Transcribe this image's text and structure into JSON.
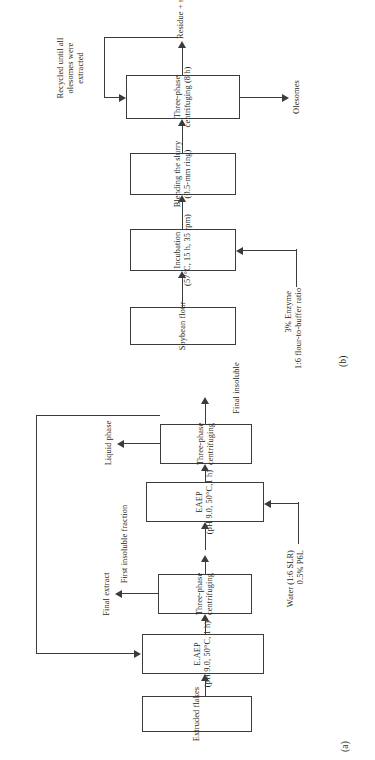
{
  "figure": {
    "type": "process-flow-diagram",
    "orientation": "rotated-90-ccw",
    "panels": [
      "a",
      "b"
    ]
  },
  "panel_b": {
    "tag": "(b)",
    "nodes": [
      {
        "id": "soybean-flour",
        "line1": "Soybean flour",
        "line2": ""
      },
      {
        "id": "incubation",
        "line1": "Incubation",
        "line2": "(57°C, 15 h, 35 rpm)"
      },
      {
        "id": "blending",
        "line1": "Blending the slurry",
        "line2": "(0.5-mm ring)"
      },
      {
        "id": "centrifuging",
        "line1": "Three-phase",
        "line2": "centrifuging (8 h)"
      }
    ],
    "labels": {
      "enzyme_l1": "3% Enzyme",
      "enzyme_l2": "1:6 flour-to-buffer ratio",
      "olesomes": "Olesomes",
      "residue": "Residue + supernatant",
      "recycle_l1": "Recycled until all",
      "recycle_l2": "olesomes were",
      "recycle_l3": "extracted"
    }
  },
  "panel_a": {
    "tag": "(a)",
    "nodes": [
      {
        "id": "extruded-flakes",
        "line1": "Extruded flakes",
        "line2": ""
      },
      {
        "id": "eaep-1",
        "line1": "E.AEP",
        "line2": "(pH 9.0, 50°C, 1 h)"
      },
      {
        "id": "centrifuging-1",
        "line1": "Three-phase",
        "line2": "centrifuging"
      },
      {
        "id": "eaep-2",
        "line1": "EAEP",
        "line2": "(pH 9.0, 50°C,1 h)"
      },
      {
        "id": "centrifuging-2",
        "line1": "Three-phase",
        "line2": "centrifuging"
      }
    ],
    "labels": {
      "final_extract": "Final extract",
      "first_insoluble": "First insoluble fraction",
      "liquid_phase": "Liquid phase",
      "final_insoluble": "Final insoluble",
      "water_l1": "Water (1:6 SLR)",
      "water_l2": "0.5% P6L"
    }
  },
  "colors": {
    "stroke": "#3b3b3b",
    "text": "#231f20",
    "background": "#ffffff"
  }
}
